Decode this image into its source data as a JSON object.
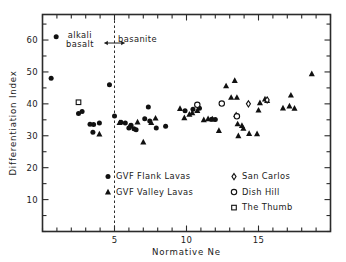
{
  "chart_data": {
    "type": "scatter",
    "title": "",
    "xlabel": "Normative  Ne",
    "ylabel": "Differentiation  Index",
    "xlim": [
      0,
      20
    ],
    "ylim": [
      0,
      68
    ],
    "grid": false,
    "x_major_ticks": [
      5,
      10,
      15
    ],
    "x_minor_step": 1,
    "y_major_ticks": [
      10,
      20,
      30,
      40,
      50,
      60
    ],
    "legend_position": "inside-bottom",
    "annotations": [
      {
        "text": "alkali\nbasalt",
        "line1": "alkali",
        "line2": "basalt",
        "x": 2.6,
        "y": 61
      },
      {
        "text": "basanite",
        "x": 6.6,
        "y": 60.5
      },
      {
        "text": "double-arrow",
        "x_from": 4.3,
        "x_to": 5.7,
        "y": 60.0
      }
    ],
    "reference_line": {
      "x": 5,
      "style": "dashed",
      "label": "alkali basalt / basanite boundary"
    },
    "series": [
      {
        "name": "GVF Flank Lavas",
        "marker": "filled-circle",
        "color": "#111111",
        "points": [
          [
            0.95,
            61.0
          ],
          [
            0.6,
            48.0
          ],
          [
            4.65,
            46.0
          ],
          [
            2.5,
            37.0
          ],
          [
            2.75,
            37.6
          ],
          [
            3.3,
            33.6
          ],
          [
            3.55,
            33.5
          ],
          [
            3.5,
            31.1
          ],
          [
            3.95,
            34.0
          ],
          [
            5.0,
            36.2
          ],
          [
            5.45,
            34.2
          ],
          [
            5.75,
            34.0
          ],
          [
            6.0,
            32.4
          ],
          [
            6.15,
            33.3
          ],
          [
            6.35,
            32.2
          ],
          [
            6.5,
            31.9
          ],
          [
            7.1,
            35.3
          ],
          [
            7.35,
            39.0
          ],
          [
            7.45,
            34.6
          ],
          [
            7.9,
            32.4
          ],
          [
            8.55,
            33.0
          ],
          [
            9.9,
            37.8
          ],
          [
            10.45,
            38.3
          ],
          [
            10.9,
            38.6
          ],
          [
            11.75,
            35.2
          ],
          [
            12.0,
            35.1
          ]
        ]
      },
      {
        "name": "GVF Valley Lavas",
        "marker": "filled-triangle",
        "color": "#111111",
        "points": [
          [
            3.95,
            30.5
          ],
          [
            5.35,
            34.1
          ],
          [
            6.05,
            33.0
          ],
          [
            6.6,
            34.3
          ],
          [
            7.0,
            28.0
          ],
          [
            7.55,
            34.1
          ],
          [
            7.85,
            35.5
          ],
          [
            9.55,
            38.5
          ],
          [
            9.85,
            35.6
          ],
          [
            10.2,
            36.7
          ],
          [
            10.4,
            37.2
          ],
          [
            10.75,
            37.9
          ],
          [
            11.2,
            35.0
          ],
          [
            11.5,
            35.3
          ],
          [
            11.8,
            35.2
          ],
          [
            12.25,
            31.6
          ],
          [
            12.75,
            45.6
          ],
          [
            13.1,
            42.0
          ],
          [
            13.35,
            47.3
          ],
          [
            13.5,
            42.0
          ],
          [
            13.45,
            36.6
          ],
          [
            13.55,
            33.7
          ],
          [
            13.6,
            30.0
          ],
          [
            13.85,
            33.2
          ],
          [
            13.95,
            32.3
          ],
          [
            14.35,
            30.7
          ],
          [
            14.9,
            30.6
          ],
          [
            15.0,
            38.0
          ],
          [
            15.1,
            40.3
          ],
          [
            15.45,
            41.5
          ],
          [
            15.6,
            41.0
          ],
          [
            16.7,
            38.7
          ],
          [
            17.15,
            39.3
          ],
          [
            17.25,
            42.7
          ],
          [
            17.5,
            38.6
          ],
          [
            18.7,
            49.4
          ]
        ]
      },
      {
        "name": "San Carlos",
        "marker": "open-diamond",
        "color": "#111111",
        "points": [
          [
            14.3,
            40.0
          ],
          [
            15.6,
            41.2
          ]
        ]
      },
      {
        "name": "Dish Hill",
        "marker": "open-circle",
        "color": "#111111",
        "points": [
          [
            10.75,
            39.7
          ],
          [
            12.45,
            40.1
          ],
          [
            13.5,
            36.1
          ]
        ]
      },
      {
        "name": "The Thumb",
        "marker": "open-square",
        "color": "#111111",
        "points": [
          [
            2.5,
            40.5
          ]
        ]
      }
    ]
  },
  "legend": {
    "left_entries": [
      {
        "label": "GVF Flank Lavas",
        "marker": "filled-circle"
      },
      {
        "label": "GVF Valley Lavas",
        "marker": "filled-triangle"
      }
    ],
    "right_entries": [
      {
        "label": "San Carlos",
        "marker": "open-diamond"
      },
      {
        "label": "Dish Hill",
        "marker": "open-circle"
      },
      {
        "label": "The Thumb",
        "marker": "open-square"
      }
    ]
  },
  "axis_labels": {
    "x_title": "Normative  Ne",
    "y_title": "Differentiation  Index"
  }
}
